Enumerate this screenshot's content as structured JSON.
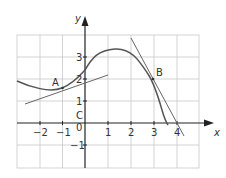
{
  "figure": {
    "type": "function-graph-with-tangents",
    "axis_labels": {
      "x": "x",
      "y": "y"
    },
    "x_ticks": [
      {
        "value": -2,
        "label": "−2"
      },
      {
        "value": -1,
        "label": "−1"
      },
      {
        "value": 0,
        "label": "0"
      },
      {
        "value": 1,
        "label": "1"
      },
      {
        "value": 2,
        "label": "2"
      },
      {
        "value": 3,
        "label": "3"
      },
      {
        "value": 4,
        "label": "4"
      }
    ],
    "y_ticks": [
      {
        "value": -1,
        "label": "−1"
      },
      {
        "value": 1,
        "label": "1"
      },
      {
        "value": 2,
        "label": "2"
      },
      {
        "value": 3,
        "label": "3"
      }
    ],
    "curve_label": "C",
    "points": [
      {
        "name": "A",
        "x": -1,
        "y": 1.6
      },
      {
        "name": "B",
        "x": 3,
        "y": 2
      }
    ],
    "grid": {
      "x_min": -3,
      "x_max": 5,
      "y_min": -2,
      "y_max": 4,
      "step": 1
    },
    "colors": {
      "grid": "#c8c8c8",
      "axis": "#222222",
      "curve": "#555555",
      "tangent": "#666666",
      "text": "#333333"
    }
  }
}
